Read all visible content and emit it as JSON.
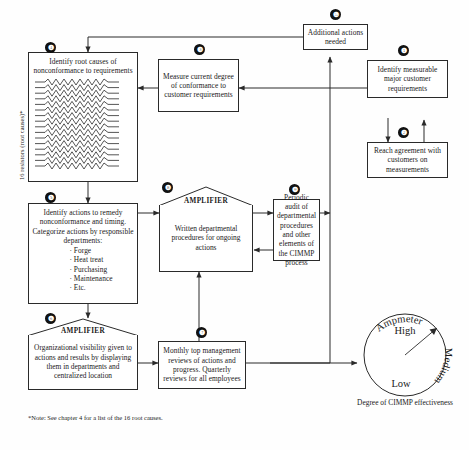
{
  "diagram": {
    "title_note": "*Note: See chapter 4 for a list of the 16 root causes.",
    "side_label": "16 resistors (root causes)*",
    "amplifier_label": "AMPLIFIER",
    "nodes": [
      {
        "id": "1",
        "num": "❶",
        "label": "Identify measurable major customer requirements"
      },
      {
        "id": "2",
        "num": "❷",
        "label": "Reach agreement with customers on measurements"
      },
      {
        "id": "3",
        "num": "❸",
        "label": "Measure current degree of conformance to customer requirements"
      },
      {
        "id": "4",
        "num": "❹",
        "label": "Identify root causes of nonconformance to requirements"
      },
      {
        "id": "5",
        "num": "❺",
        "label": "Identify actions to remedy nonconformance and timing. Categorize actions by responsible departments:"
      },
      {
        "id": "6",
        "num": "❻",
        "label": "Organizational visibility given to actions and results by displaying them in departments and centralized location"
      },
      {
        "id": "7",
        "num": "❼",
        "label": "Monthly top management reviews of actions and progress. Quarterly reviews for all employees"
      },
      {
        "id": "8",
        "num": "❽",
        "label": "Written departmental procedures for ongoing actions"
      },
      {
        "id": "9",
        "num": "❾",
        "label": "Periodic audit of departmental procedures and other elements of the CIMMP process"
      },
      {
        "id": "10",
        "num": "❿",
        "label": "Additional actions needed"
      }
    ],
    "departments": [
      "· Forge",
      "· Heat treat",
      "· Purchasing",
      "· Maintenance",
      "· Etc."
    ],
    "gauge": {
      "title": "Ampmeter",
      "high": "High",
      "medium": "Medium",
      "low": "Low",
      "caption": "Degree of CIMMP effectiveness"
    },
    "colors": {
      "stroke": "#2a2a2a",
      "badge_bg": "#111111",
      "background": "#fefefe"
    }
  }
}
